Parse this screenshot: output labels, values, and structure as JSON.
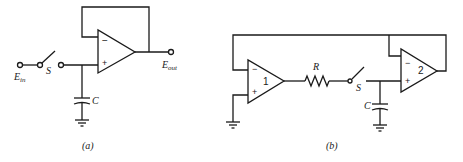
{
  "diagram_a": {
    "caption": "(a)",
    "input_label": "E",
    "input_sub": "in",
    "output_label": "E",
    "output_sub": "out",
    "switch_label": "S",
    "capacitor_label": "C",
    "opamp_minus": "−",
    "opamp_plus": "+"
  },
  "diagram_b": {
    "caption": "(b)",
    "resistor_label": "R",
    "switch_label": "S",
    "capacitor_label": "C",
    "opamp1_label": "1",
    "opamp2_label": "2",
    "opamp_minus": "−",
    "opamp_plus": "+"
  }
}
